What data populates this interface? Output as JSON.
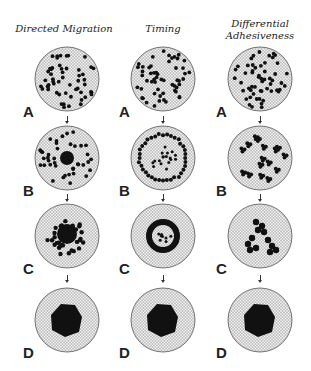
{
  "columns": [
    {
      "title": "Directed Migration",
      "cx": 67
    },
    {
      "title": "Timing",
      "cx": 163
    },
    {
      "title": "Differential Adhesiveness",
      "title_line1": "Differential",
      "title_line2": "Adhesiveness",
      "cx": 260
    }
  ],
  "rows": [
    {
      "label": "A",
      "cy": 79
    },
    {
      "label": "B",
      "cy": 158
    },
    {
      "label": "C",
      "cy": 236
    },
    {
      "label": "D",
      "cy": 320
    }
  ],
  "stage_descriptions": {
    "directed_migration": [
      "scattered cells",
      "central cluster with surrounding cells",
      "cells converging toward center",
      "single central aggregate"
    ],
    "timing": [
      "scattered cells",
      "ring of cells forming",
      "closed ring aggregate",
      "single central aggregate"
    ],
    "differential_adhesiveness": [
      "scattered cells",
      "small clusters",
      "branching clusters merging",
      "single central aggregate"
    ]
  },
  "colors": {
    "ink": "#111111",
    "grid": "#8a8a8a",
    "paper": "#ffffff"
  }
}
